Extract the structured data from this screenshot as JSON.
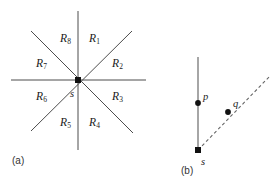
{
  "figure": {
    "background_color": "#ffffff",
    "line_color": "#4d4d4d",
    "dash_color": "#666666",
    "marker_color": "#111111",
    "text_color": "#1a1a1a"
  },
  "panel_a": {
    "caption": "(a)",
    "center_marker_name": "center-point-s",
    "center_label": "s",
    "regions": [
      {
        "id": "R1",
        "base": "R",
        "sub": "1"
      },
      {
        "id": "R2",
        "base": "R",
        "sub": "2"
      },
      {
        "id": "R3",
        "base": "R",
        "sub": "3"
      },
      {
        "id": "R4",
        "base": "R",
        "sub": "4"
      },
      {
        "id": "R5",
        "base": "R",
        "sub": "5"
      },
      {
        "id": "R6",
        "base": "R",
        "sub": "6"
      },
      {
        "id": "R7",
        "base": "R",
        "sub": "7"
      },
      {
        "id": "R8",
        "base": "R",
        "sub": "8"
      }
    ]
  },
  "panel_b": {
    "caption": "(b)",
    "source_label": "s",
    "point_p_label": "p",
    "point_q_label": "q"
  }
}
